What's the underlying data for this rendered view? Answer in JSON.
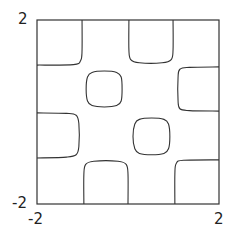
{
  "chart_data": {
    "type": "contour",
    "title": "",
    "xlabel": "",
    "ylabel": "",
    "xlim": [
      -2,
      2
    ],
    "ylim": [
      -2,
      2
    ],
    "grid": false,
    "legend": null,
    "x_tick_labels": [
      "-2",
      "2"
    ],
    "y_tick_labels": [
      "-2",
      "2"
    ],
    "line_color": "#333333",
    "frame_color": "#333333",
    "contours": [
      {
        "name": "top-left-corner",
        "points": [
          [
            -1.01,
            2.0
          ],
          [
            -1.01,
            1.35
          ],
          [
            -1.04,
            1.12
          ],
          [
            -1.2,
            1.03
          ],
          [
            -2.0,
            1.02
          ]
        ]
      },
      {
        "name": "top-center-u",
        "points": [
          [
            0.02,
            2.0
          ],
          [
            0.02,
            1.35
          ],
          [
            0.06,
            1.14
          ],
          [
            0.25,
            1.07
          ],
          [
            0.75,
            1.07
          ],
          [
            0.95,
            1.14
          ],
          [
            0.99,
            1.35
          ],
          [
            0.99,
            2.0
          ]
        ]
      },
      {
        "name": "right-c",
        "points": [
          [
            2.0,
            0.98
          ],
          [
            1.35,
            0.97
          ],
          [
            1.14,
            0.93
          ],
          [
            1.1,
            0.75
          ],
          [
            1.1,
            0.25
          ],
          [
            1.14,
            0.07
          ],
          [
            1.35,
            0.03
          ],
          [
            2.0,
            0.02
          ]
        ]
      },
      {
        "name": "upper-left-blob",
        "closed": true,
        "points": [
          [
            -0.52,
            0.89
          ],
          [
            -0.25,
            0.86
          ],
          [
            -0.15,
            0.76
          ],
          [
            -0.13,
            0.5
          ],
          [
            -0.15,
            0.24
          ],
          [
            -0.25,
            0.14
          ],
          [
            -0.52,
            0.11
          ],
          [
            -0.79,
            0.14
          ],
          [
            -0.89,
            0.24
          ],
          [
            -0.92,
            0.5
          ],
          [
            -0.89,
            0.76
          ],
          [
            -0.79,
            0.86
          ]
        ]
      },
      {
        "name": "left-d",
        "points": [
          [
            -2.0,
            -0.02
          ],
          [
            -1.35,
            -0.03
          ],
          [
            -1.14,
            -0.07
          ],
          [
            -1.08,
            -0.25
          ],
          [
            -1.08,
            -0.75
          ],
          [
            -1.14,
            -0.93
          ],
          [
            -1.35,
            -0.98
          ],
          [
            -2.0,
            -1.0
          ]
        ]
      },
      {
        "name": "lower-right-blob",
        "closed": true,
        "points": [
          [
            0.52,
            -0.13
          ],
          [
            0.79,
            -0.16
          ],
          [
            0.89,
            -0.26
          ],
          [
            0.92,
            -0.53
          ],
          [
            0.89,
            -0.8
          ],
          [
            0.79,
            -0.9
          ],
          [
            0.52,
            -0.93
          ],
          [
            0.25,
            -0.9
          ],
          [
            0.15,
            -0.8
          ],
          [
            0.11,
            -0.53
          ],
          [
            0.15,
            -0.26
          ],
          [
            0.25,
            -0.16
          ]
        ]
      },
      {
        "name": "bottom-center-u",
        "points": [
          [
            -0.97,
            -2.0
          ],
          [
            -0.97,
            -1.35
          ],
          [
            -0.93,
            -1.14
          ],
          [
            -0.75,
            -1.07
          ],
          [
            -0.22,
            -1.07
          ],
          [
            -0.04,
            -1.14
          ],
          [
            0.0,
            -1.35
          ],
          [
            0.0,
            -2.0
          ]
        ]
      },
      {
        "name": "bottom-right-corner",
        "points": [
          [
            1.03,
            -2.0
          ],
          [
            1.03,
            -1.35
          ],
          [
            1.06,
            -1.12
          ],
          [
            1.22,
            -1.05
          ],
          [
            2.0,
            -1.04
          ]
        ]
      }
    ]
  },
  "axes": {
    "x_min_label": "-2",
    "x_max_label": "2",
    "y_min_label": "-2",
    "y_max_label": "2"
  },
  "layout": {
    "frame": {
      "left": 37,
      "top": 20,
      "right": 219,
      "bottom": 204
    }
  }
}
